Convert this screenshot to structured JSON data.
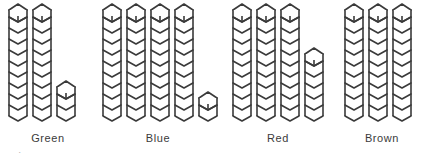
{
  "figure": {
    "title": "",
    "background_color": "#ffffff",
    "stroke_color": "#3a3a3a",
    "fill_color": "#ffffff",
    "label_color": "#3b3b3b"
  },
  "chart_data": {
    "type": "bar",
    "subtype": "unit-block-pictograph",
    "title": "",
    "xlabel": "",
    "ylabel": "",
    "unit_label": "block",
    "blocks_per_full_column": 10,
    "categories": [
      "Green",
      "Blue",
      "Red",
      "Brown"
    ],
    "values": [
      23,
      42,
      36,
      30
    ],
    "columns": [
      [
        10,
        10,
        3
      ],
      [
        10,
        10,
        10,
        10,
        2
      ],
      [
        10,
        10,
        10,
        6
      ],
      [
        10,
        10,
        10
      ]
    ],
    "ylim": [
      0,
      42
    ],
    "grid": false,
    "legend": null
  },
  "groups": [
    {
      "name": "green",
      "label": "Green",
      "total": 23,
      "columns": [
        10,
        10,
        3
      ]
    },
    {
      "name": "blue",
      "label": "Blue",
      "total": 42,
      "columns": [
        10,
        10,
        10,
        10,
        2
      ]
    },
    {
      "name": "red",
      "label": "Red",
      "total": 36,
      "columns": [
        10,
        10,
        10,
        6
      ]
    },
    {
      "name": "brown",
      "label": "Brown",
      "total": 30,
      "columns": [
        10,
        10,
        10
      ]
    }
  ],
  "footer": {
    "clipped_text": "·  ▬"
  }
}
